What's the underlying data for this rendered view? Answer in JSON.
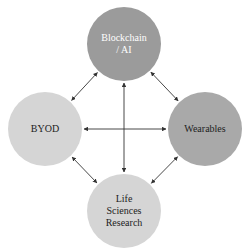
{
  "diagram": {
    "type": "network",
    "nodes": [
      {
        "id": "blockchain",
        "label_lines": [
          "Blockchain",
          "/ AI"
        ],
        "cx": 124,
        "cy": 44,
        "r": 37,
        "fill": "#9b9b9b",
        "text_color": "#ffffff"
      },
      {
        "id": "byod",
        "label_lines": [
          "BYOD"
        ],
        "cx": 45,
        "cy": 129,
        "r": 37,
        "fill": "#d5d5d5",
        "text_color": "#222222"
      },
      {
        "id": "wearables",
        "label_lines": [
          "Wearables"
        ],
        "cx": 205,
        "cy": 129,
        "r": 37,
        "fill": "#a9a9a9",
        "text_color": "#222222"
      },
      {
        "id": "life-sciences",
        "label_lines": [
          "Life",
          "Sciences",
          "Research"
        ],
        "cx": 124,
        "cy": 211,
        "r": 37,
        "fill": "#d5d5d5",
        "text_color": "#222222"
      }
    ],
    "edges": [
      {
        "from": "blockchain",
        "to": "byod",
        "bidirectional": true
      },
      {
        "from": "blockchain",
        "to": "wearables",
        "bidirectional": true
      },
      {
        "from": "blockchain",
        "to": "life-sciences",
        "bidirectional": true
      },
      {
        "from": "byod",
        "to": "wearables",
        "bidirectional": true
      },
      {
        "from": "byod",
        "to": "life-sciences",
        "bidirectional": true
      },
      {
        "from": "wearables",
        "to": "life-sciences",
        "bidirectional": true
      }
    ],
    "edge_color": "#333333"
  }
}
